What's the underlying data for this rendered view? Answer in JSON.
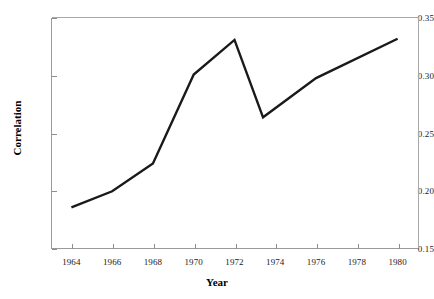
{
  "chart_data": {
    "type": "line",
    "title": "",
    "xlabel": "Year",
    "ylabel": "Correlation",
    "xlim": [
      1963,
      1981
    ],
    "ylim": [
      0.15,
      0.35
    ],
    "grid": false,
    "legend": null,
    "xticks": [
      "1964",
      "1966",
      "1968",
      "1970",
      "1972",
      "1974",
      "1976",
      "1978",
      "1980"
    ],
    "xtick_values": [
      1964,
      1966,
      1968,
      1970,
      1972,
      1974,
      1976,
      1978,
      1980
    ],
    "yticks": [
      "0.15",
      "0.20",
      "0.25",
      "0.30",
      "0.35"
    ],
    "ytick_values": [
      0.15,
      0.2,
      0.25,
      0.3,
      0.35
    ],
    "series": [
      {
        "name": "Correlation",
        "color": "#1a1a1a",
        "x": [
          1964,
          1966,
          1968,
          1970,
          1972,
          1973.4,
          1976,
          1980
        ],
        "values": [
          0.186,
          0.2,
          0.224,
          0.301,
          0.331,
          0.264,
          0.298,
          0.332
        ]
      }
    ]
  },
  "axes": {
    "x_title": "Year",
    "y_title": "Correlation"
  }
}
